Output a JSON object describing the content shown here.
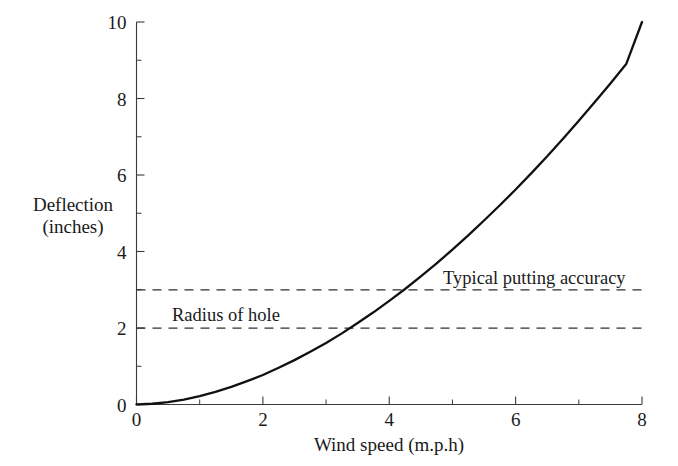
{
  "chart_data": {
    "type": "line",
    "title": "",
    "subtitle": "",
    "xlabel": "Wind speed (m.p.h)",
    "ylabel": "Deflection\n(inches)",
    "ylabel_line1": "Deflection",
    "ylabel_line2": "(inches)",
    "xlim": [
      0,
      8
    ],
    "ylim": [
      0,
      10
    ],
    "grid": false,
    "legend_position": "none",
    "x_ticks_major": [
      0,
      2,
      4,
      6,
      8
    ],
    "x_tick_labels": [
      "0",
      "2",
      "4",
      "6",
      "8"
    ],
    "x_ticks_minor": [
      1,
      3,
      5,
      7
    ],
    "y_ticks_major": [
      0,
      2,
      4,
      6,
      8,
      10
    ],
    "y_tick_labels": [
      "0",
      "2",
      "4",
      "6",
      "8",
      "10"
    ],
    "y_ticks_minor": [
      1,
      3,
      5,
      7,
      9
    ],
    "series": [
      {
        "name": "Deflection vs wind speed",
        "style": "solid",
        "color": "#111111",
        "x": [
          0,
          0.25,
          0.5,
          0.75,
          1,
          1.25,
          1.5,
          1.75,
          2,
          2.25,
          2.5,
          2.75,
          3,
          3.25,
          3.5,
          3.75,
          4,
          4.25,
          4.5,
          4.75,
          5,
          5.25,
          5.5,
          5.75,
          6,
          6.25,
          6.5,
          6.75,
          7,
          7.25,
          7.5,
          7.75,
          8
        ],
        "y": [
          0,
          0.02,
          0.06,
          0.13,
          0.22,
          0.33,
          0.46,
          0.61,
          0.77,
          0.96,
          1.16,
          1.38,
          1.61,
          1.86,
          2.13,
          2.41,
          2.71,
          3.02,
          3.35,
          3.69,
          4.05,
          4.42,
          4.81,
          5.21,
          5.62,
          6.05,
          6.49,
          6.95,
          7.42,
          7.9,
          8.39,
          8.9,
          10
        ]
      }
    ],
    "reference_lines": [
      {
        "name": "Typical putting accuracy",
        "orientation": "horizontal",
        "value": 3,
        "style": "dashed",
        "label": "Typical putting accuracy",
        "crosses_curve_at_x": 4.25
      },
      {
        "name": "Radius of hole",
        "orientation": "horizontal",
        "value": 2,
        "style": "dashed",
        "label": "Radius of hole",
        "crosses_curve_at_x": 3.5
      }
    ],
    "annotations": [
      {
        "text": "Typical putting accuracy",
        "x": 4.85,
        "y": 3.4
      },
      {
        "text": "Radius of hole",
        "x": 0.55,
        "y": 2.45
      }
    ],
    "colors": {
      "background": "#ffffff",
      "axis": "#3a3a3a",
      "curve": "#111111",
      "reference": "#2e2e2e",
      "text": "#1a1a1a"
    }
  }
}
